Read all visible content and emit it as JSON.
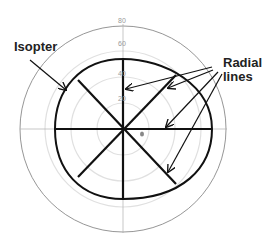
{
  "diagram": {
    "labels": {
      "isopter": "Isopter",
      "radial_lines_1": "Radial",
      "radial_lines_2": "lines"
    },
    "scale_ticks": [
      "80",
      "60",
      "40",
      "20"
    ],
    "colors": {
      "ink": "#111111",
      "grid": "#d8d8d8",
      "outer_circle": "#888888"
    }
  }
}
